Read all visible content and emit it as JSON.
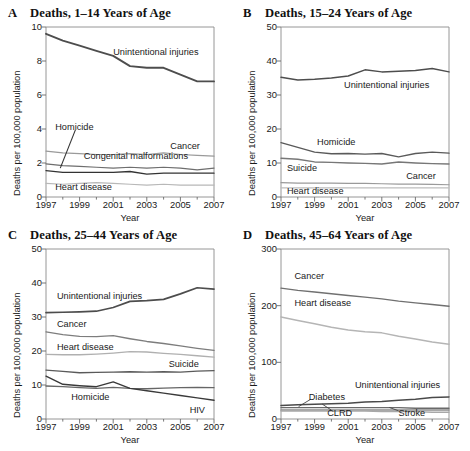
{
  "figure": {
    "ylabel": "Deaths per 100,000 population",
    "xlabel": "Year",
    "caption": ""
  },
  "chart_data": [
    {
      "type": "line",
      "panel": "A",
      "panel_label": "A",
      "title": "Deaths, 1–14 Years of Age",
      "xlabel": "Year",
      "ylabel": "Deaths per 100,000 population",
      "x": [
        1997,
        1998,
        1999,
        2000,
        2001,
        2002,
        2003,
        2004,
        2005,
        2006,
        2007
      ],
      "xlim": [
        1997,
        2007
      ],
      "ylim": [
        0,
        10
      ],
      "yticks": [
        0,
        2,
        4,
        6,
        8,
        10
      ],
      "xticks": [
        1997,
        1999,
        2001,
        2003,
        2005,
        2007
      ],
      "grid": false,
      "legend": "inline-labels",
      "series": [
        {
          "name": "Unintentional injuries",
          "color": "#4d4d4d",
          "width": 1.9,
          "values": [
            9.6,
            9.2,
            8.9,
            8.6,
            8.3,
            7.7,
            7.6,
            7.6,
            7.2,
            6.8,
            6.8
          ]
        },
        {
          "name": "Cancer",
          "color": "#9a9a9a",
          "width": 1.2,
          "values": [
            2.7,
            2.6,
            2.55,
            2.5,
            2.5,
            2.55,
            2.5,
            2.6,
            2.5,
            2.45,
            2.4
          ]
        },
        {
          "name": "Congenital malformations",
          "color": "#6e6e6e",
          "width": 1.2,
          "values": [
            1.95,
            1.85,
            1.8,
            1.75,
            1.7,
            1.75,
            1.7,
            1.75,
            1.7,
            1.6,
            1.7
          ]
        },
        {
          "name": "Homicide",
          "color": "#333333",
          "width": 1.3,
          "values": [
            1.55,
            1.45,
            1.45,
            1.45,
            1.45,
            1.5,
            1.35,
            1.4,
            1.4,
            1.4,
            1.4
          ]
        },
        {
          "name": "Heart disease",
          "color": "#b8b8b8",
          "width": 1.2,
          "values": [
            0.8,
            0.75,
            0.8,
            0.85,
            0.8,
            0.75,
            0.7,
            0.75,
            0.7,
            0.7,
            0.7
          ]
        }
      ],
      "labels": [
        {
          "text": "Unintentional injuries",
          "x": 0.4,
          "y": 0.845
        },
        {
          "text": "Homicide",
          "x": 0.055,
          "y": 0.405
        },
        {
          "text": "Cancer",
          "x": 0.74,
          "y": 0.295
        },
        {
          "text": "Congenital malformations",
          "x": 0.225,
          "y": 0.235
        },
        {
          "text": "Heart disease",
          "x": 0.055,
          "y": 0.055
        }
      ]
    },
    {
      "type": "line",
      "panel": "B",
      "panel_label": "B",
      "title": "Deaths, 15–24 Years of Age",
      "xlabel": "Year",
      "ylabel": "Deaths per 100,000 population",
      "x": [
        1997,
        1998,
        1999,
        2000,
        2001,
        2002,
        2003,
        2004,
        2005,
        2006,
        2007
      ],
      "xlim": [
        1997,
        2007
      ],
      "ylim": [
        0,
        50
      ],
      "yticks": [
        0,
        10,
        20,
        30,
        40,
        50
      ],
      "xticks": [
        1997,
        1999,
        2001,
        2003,
        2005,
        2007
      ],
      "grid": false,
      "legend": "inline-labels",
      "series": [
        {
          "name": "Unintentional injuries",
          "color": "#4d4d4d",
          "width": 1.5,
          "values": [
            35.2,
            34.4,
            34.6,
            35.0,
            35.6,
            37.4,
            36.8,
            37.0,
            37.2,
            37.8,
            36.8
          ]
        },
        {
          "name": "Homicide",
          "color": "#5a5a5a",
          "width": 1.4,
          "values": [
            16.0,
            14.6,
            13.2,
            12.7,
            12.8,
            12.6,
            12.8,
            11.8,
            12.8,
            13.2,
            12.9
          ]
        },
        {
          "name": "Suicide",
          "color": "#777777",
          "width": 1.3,
          "values": [
            11.4,
            11.1,
            10.3,
            10.2,
            10.0,
            9.9,
            9.7,
            10.3,
            10.0,
            9.8,
            9.7
          ]
        },
        {
          "name": "Cancer",
          "color": "#9a9a9a",
          "width": 1.2,
          "values": [
            4.2,
            4.1,
            4.1,
            4.1,
            4.0,
            4.0,
            3.9,
            3.8,
            3.8,
            3.7,
            3.6
          ]
        },
        {
          "name": "Heart disease",
          "color": "#bdbdbd",
          "width": 1.2,
          "values": [
            2.7,
            2.7,
            2.7,
            2.7,
            2.7,
            2.7,
            2.7,
            2.7,
            2.7,
            2.7,
            2.7
          ]
        }
      ],
      "labels": [
        {
          "text": "Unintentional injuries",
          "x": 0.375,
          "y": 0.655
        },
        {
          "text": "Homicide",
          "x": 0.215,
          "y": 0.315
        },
        {
          "text": "Suicide",
          "x": 0.035,
          "y": 0.165
        },
        {
          "text": "Cancer",
          "x": 0.745,
          "y": 0.115
        },
        {
          "text": "Heart disease",
          "x": 0.035,
          "y": 0.028
        }
      ]
    },
    {
      "type": "line",
      "panel": "C",
      "panel_label": "C",
      "title": "Deaths, 25–44 Years of Age",
      "xlabel": "Year",
      "ylabel": "Deaths per 100,000 population",
      "x": [
        1997,
        1998,
        1999,
        2000,
        2001,
        2002,
        2003,
        2004,
        2005,
        2006,
        2007
      ],
      "xlim": [
        1997,
        2007
      ],
      "ylim": [
        0,
        50
      ],
      "yticks": [
        0,
        10,
        20,
        30,
        40,
        50
      ],
      "xticks": [
        1997,
        1999,
        2001,
        2003,
        2005,
        2007
      ],
      "grid": false,
      "legend": "inline-labels",
      "series": [
        {
          "name": "Unintentional injuries",
          "color": "#4d4d4d",
          "width": 1.7,
          "values": [
            31.3,
            31.4,
            31.5,
            31.7,
            32.8,
            34.6,
            34.8,
            35.2,
            36.8,
            38.6,
            38.2
          ]
        },
        {
          "name": "Cancer",
          "color": "#7d7d7d",
          "width": 1.3,
          "values": [
            25.6,
            24.8,
            24.3,
            24.2,
            24.5,
            23.6,
            22.8,
            22.2,
            21.5,
            20.8,
            20.2
          ]
        },
        {
          "name": "Heart disease",
          "color": "#b0b0b0",
          "width": 1.3,
          "values": [
            19.0,
            18.9,
            18.9,
            19.1,
            19.4,
            19.8,
            19.7,
            19.3,
            19.0,
            18.6,
            18.2
          ]
        },
        {
          "name": "Suicide",
          "color": "#5a5a5a",
          "width": 1.3,
          "values": [
            14.4,
            14.0,
            13.6,
            13.7,
            13.8,
            13.9,
            13.8,
            13.9,
            13.8,
            14.1,
            14.2
          ]
        },
        {
          "name": "Homicide",
          "color": "#666666",
          "width": 1.3,
          "values": [
            9.7,
            9.5,
            9.2,
            9.0,
            9.3,
            9.0,
            8.9,
            9.1,
            9.2,
            9.3,
            9.2
          ]
        },
        {
          "name": "HIV",
          "color": "#3a3a3a",
          "width": 1.4,
          "values": [
            12.6,
            10.2,
            9.8,
            9.5,
            10.9,
            9.0,
            8.3,
            7.6,
            6.9,
            6.2,
            5.5
          ]
        }
      ],
      "labels": [
        {
          "text": "Unintentional injuries",
          "x": 0.065,
          "y": 0.715
        },
        {
          "text": "Cancer",
          "x": 0.065,
          "y": 0.555
        },
        {
          "text": "Heart disease",
          "x": 0.065,
          "y": 0.415
        },
        {
          "text": "Suicide",
          "x": 0.73,
          "y": 0.315
        },
        {
          "text": "Homicide",
          "x": 0.15,
          "y": 0.125
        },
        {
          "text": "HIV",
          "x": 0.855,
          "y": 0.045
        }
      ]
    },
    {
      "type": "line",
      "panel": "D",
      "panel_label": "D",
      "title": "Deaths, 45–64 Years of Age",
      "xlabel": "Year",
      "ylabel": "Deaths per 100,000 population",
      "x": [
        1997,
        1998,
        1999,
        2000,
        2001,
        2002,
        2003,
        2004,
        2005,
        2006,
        2007
      ],
      "xlim": [
        1997,
        2007
      ],
      "ylim": [
        0,
        300
      ],
      "yticks": [
        0,
        100,
        200,
        300
      ],
      "xticks": [
        1997,
        1999,
        2001,
        2003,
        2005,
        2007
      ],
      "grid": false,
      "legend": "inline-labels",
      "series": [
        {
          "name": "Cancer",
          "color": "#707070",
          "width": 1.4,
          "values": [
            231,
            227,
            224,
            221,
            218,
            215,
            212,
            208,
            205,
            202,
            199
          ]
        },
        {
          "name": "Heart disease",
          "color": "#b5b5b5",
          "width": 1.5,
          "values": [
            180,
            174,
            168,
            162,
            157,
            154,
            152,
            146,
            141,
            136,
            132
          ]
        },
        {
          "name": "Unintentional injuries",
          "color": "#4a4a4a",
          "width": 1.5,
          "values": [
            24,
            25,
            26,
            27,
            28,
            30,
            31,
            33,
            35,
            38,
            39
          ]
        },
        {
          "name": "Diabetes",
          "color": "#6a6a6a",
          "width": 1.4,
          "values": [
            20,
            20,
            20,
            20,
            20,
            20,
            20,
            20,
            19,
            19,
            19
          ]
        },
        {
          "name": "CLRD",
          "color": "#8c8c8c",
          "width": 1.4,
          "values": [
            16,
            16,
            16,
            16,
            16,
            16,
            16,
            16,
            16,
            16,
            16
          ]
        },
        {
          "name": "Stroke",
          "color": "#a8a8a8",
          "width": 1.4,
          "values": [
            14,
            14,
            14,
            14,
            14,
            14,
            13,
            13,
            13,
            12,
            12
          ]
        }
      ],
      "labels": [
        {
          "text": "Cancer",
          "x": 0.08,
          "y": 0.835
        },
        {
          "text": "Heart disease",
          "x": 0.08,
          "y": 0.675
        },
        {
          "text": "Unintentional injuries",
          "x": 0.44,
          "y": 0.195
        },
        {
          "text": "Diabetes",
          "x": 0.165,
          "y": 0.125
        },
        {
          "text": "CLRD",
          "x": 0.275,
          "y": 0.028
        },
        {
          "text": "Stroke",
          "x": 0.7,
          "y": 0.028
        }
      ],
      "leaders": [
        {
          "from": [
            0.175,
            0.115
          ],
          "to": [
            0.105,
            0.073
          ]
        },
        {
          "from": [
            0.3,
            0.052
          ],
          "to": [
            0.245,
            0.088
          ]
        },
        {
          "from": [
            0.7,
            0.048
          ],
          "to": [
            0.645,
            0.068
          ]
        }
      ]
    }
  ]
}
